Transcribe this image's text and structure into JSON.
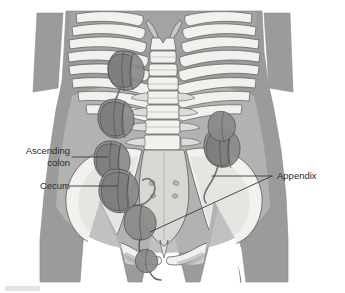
{
  "figure": {
    "width": 345,
    "height": 293,
    "background_color": "#ffffff"
  },
  "labels": {
    "ascending_colon": "Ascending\ncolon",
    "cecum": "Cecum",
    "appendix": "Appendix"
  },
  "colors": {
    "background": "#ffffff",
    "body_silhouette": "#9b9b9b",
    "body_silhouette_light": "#b4b4b4",
    "bone_fill": "#f2f1ee",
    "bone_shadow": "#d6d5d2",
    "bone_outline": "#4a4a4a",
    "organ_fill": "#8a8a8a",
    "organ_fill_dark": "#787878",
    "organ_outline": "#4a4a4a",
    "leader_line": "#3a3a3a",
    "label_text": "#2b2b2b",
    "corner_mark": "#e3e3e3"
  },
  "leader_lines": {
    "ascending_colon": {
      "x1": 72,
      "y1": 157,
      "x2": 108,
      "y2": 157
    },
    "cecum": {
      "x1": 70,
      "y1": 186,
      "x2": 118,
      "y2": 186
    },
    "appendix_upper": {
      "x1": 272,
      "y1": 176,
      "x2": 212,
      "y2": 176
    },
    "appendix_lower": {
      "x1": 272,
      "y1": 176,
      "x2": 150,
      "y2": 232
    }
  },
  "anatomy": {
    "structures": [
      "rib-cage",
      "lumbar-spine",
      "pelvis",
      "sacrum",
      "femurs",
      "ascending-colon",
      "cecum",
      "appendix"
    ],
    "appendix_positions": 3
  }
}
